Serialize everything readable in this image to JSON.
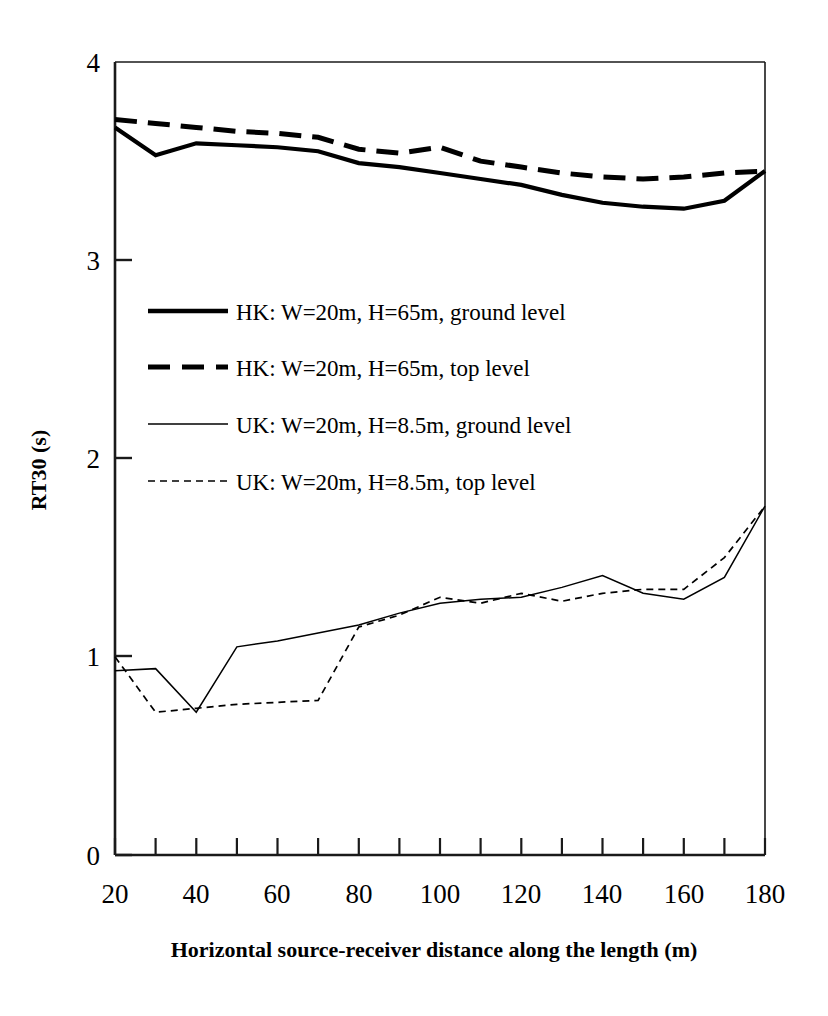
{
  "chart_data": {
    "type": "line",
    "title": "",
    "xlabel": "Horizontal source-receiver distance along the length (m)",
    "ylabel": "RT30 (s)",
    "xlim": [
      20,
      180
    ],
    "ylim": [
      0,
      4
    ],
    "x_ticks_labeled": [
      20,
      40,
      60,
      80,
      100,
      120,
      140,
      160,
      180
    ],
    "x_ticks_minor": [
      30,
      50,
      70,
      90,
      110,
      130,
      150,
      170
    ],
    "y_ticks": [
      0,
      1,
      2,
      3,
      4
    ],
    "grid": false,
    "legend_position": "inside-upper-left",
    "x": [
      20,
      30,
      40,
      50,
      60,
      70,
      80,
      90,
      100,
      110,
      120,
      130,
      140,
      150,
      160,
      170,
      180
    ],
    "series": [
      {
        "name": "HK: W=20m, H=65m, ground level",
        "style": "solid-thick",
        "values": [
          3.67,
          3.53,
          3.59,
          3.58,
          3.57,
          3.55,
          3.49,
          3.47,
          3.44,
          3.41,
          3.38,
          3.33,
          3.29,
          3.27,
          3.26,
          3.3,
          3.45
        ]
      },
      {
        "name": "HK: W=20m, H=65m, top level",
        "style": "dashed-thick",
        "values": [
          3.71,
          3.69,
          3.67,
          3.65,
          3.64,
          3.62,
          3.56,
          3.54,
          3.57,
          3.5,
          3.47,
          3.44,
          3.42,
          3.41,
          3.42,
          3.44,
          3.45
        ]
      },
      {
        "name": "UK: W=20m, H=8.5m, ground level",
        "style": "solid-thin",
        "values": [
          0.93,
          0.94,
          0.72,
          1.05,
          1.08,
          1.12,
          1.16,
          1.22,
          1.27,
          1.29,
          1.3,
          1.35,
          1.41,
          1.32,
          1.29,
          1.4,
          1.76
        ]
      },
      {
        "name": "UK: W=20m, H=8.5m, top level",
        "style": "dashed-thin",
        "values": [
          1.0,
          0.72,
          0.74,
          0.76,
          0.77,
          0.78,
          1.15,
          1.21,
          1.3,
          1.27,
          1.32,
          1.28,
          1.32,
          1.34,
          1.34,
          1.5,
          1.76
        ]
      }
    ]
  },
  "axis": {
    "y_title": "RT30 (s)",
    "x_title": "Horizontal source-receiver distance along the length (m)",
    "y_labels": [
      "4",
      "3",
      "2",
      "1",
      "0"
    ],
    "x_labels": [
      "20",
      "40",
      "60",
      "80",
      "100",
      "120",
      "140",
      "160",
      "180"
    ]
  },
  "legend": {
    "items": [
      {
        "label": "HK: W=20m, H=65m, ground level",
        "style": "solid-thick"
      },
      {
        "label": "HK: W=20m, H=65m, top level",
        "style": "dashed-thick"
      },
      {
        "label": "UK: W=20m, H=8.5m, ground level",
        "style": "solid-thin"
      },
      {
        "label": "UK: W=20m, H=8.5m, top level",
        "style": "dashed-thin"
      }
    ]
  },
  "colors": {
    "line": "#000000",
    "axis": "#1a1a1a",
    "background": "#ffffff"
  }
}
